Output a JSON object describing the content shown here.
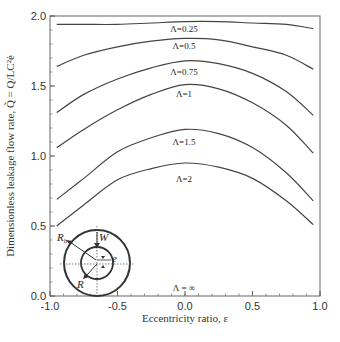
{
  "chart_data": {
    "type": "line",
    "title": "",
    "xlabel": "Eccentricity ratio, ε",
    "ylabel": "Dimensionless leakage flow rate, Q̃ = Q/LC²ė",
    "xlim": [
      -1.0,
      1.0
    ],
    "ylim": [
      0.0,
      2.0
    ],
    "xticks": [
      "-1.0",
      "-0.5",
      "0.0",
      "0.5",
      "1.0"
    ],
    "yticks": [
      "0.0",
      "0.5",
      "1.0",
      "1.5",
      "2.0"
    ],
    "grid": false,
    "legend": "inline labels",
    "x": [
      -0.95,
      -0.75,
      -0.5,
      -0.25,
      0.0,
      0.25,
      0.5,
      0.75,
      0.95
    ],
    "series": [
      {
        "name": "Λ=0.25",
        "values": [
          1.94,
          1.94,
          1.94,
          1.95,
          1.96,
          1.96,
          1.95,
          1.94,
          1.91
        ]
      },
      {
        "name": "Λ=0.5",
        "values": [
          1.64,
          1.72,
          1.78,
          1.82,
          1.84,
          1.83,
          1.78,
          1.72,
          1.62
        ]
      },
      {
        "name": "Λ=0.75",
        "values": [
          1.31,
          1.44,
          1.55,
          1.63,
          1.68,
          1.66,
          1.59,
          1.46,
          1.29
        ]
      },
      {
        "name": "Λ=1",
        "values": [
          1.06,
          1.19,
          1.33,
          1.44,
          1.51,
          1.48,
          1.38,
          1.22,
          1.02
        ]
      },
      {
        "name": "Λ=1.5",
        "values": [
          0.69,
          0.84,
          1.03,
          1.13,
          1.19,
          1.16,
          1.06,
          0.88,
          0.68
        ]
      },
      {
        "name": "Λ=2",
        "values": [
          0.5,
          0.65,
          0.83,
          0.91,
          0.95,
          0.92,
          0.84,
          0.68,
          0.51
        ]
      },
      {
        "name": "Λ = ∞",
        "values": [
          0,
          0,
          0,
          0,
          0,
          0,
          0,
          0,
          0
        ]
      }
    ],
    "annotations": [
      "Λ=0.25",
      "Λ=0.5",
      "Λ=0.75",
      "Λ=1",
      "Λ=1.5",
      "Λ=2",
      "Λ = ∞"
    ],
    "inset": {
      "description": "eccentric circles diagram",
      "labels": [
        "R_b",
        "W",
        "e",
        "R"
      ]
    }
  },
  "labels": {
    "xlabel": "Eccentricity ratio, ε",
    "ylabel": "Dimensionless leakage flow rate, Q̃ = Q/LC²ė",
    "inset_rb": "R",
    "inset_rb_sub": "b",
    "inset_w": "W",
    "inset_e": "e",
    "inset_r": "R"
  },
  "colors": {
    "curve": "#444444",
    "frame": "#666666",
    "text": "#333333"
  }
}
